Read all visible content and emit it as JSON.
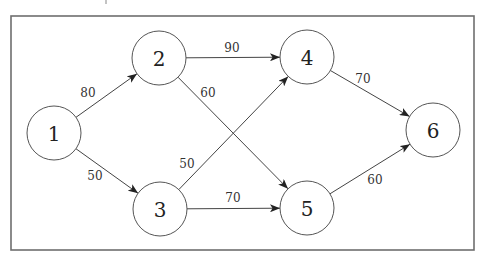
{
  "diagram": {
    "type": "directed-weighted-graph",
    "frame": {
      "x1": 11,
      "y1": 16,
      "x2": 474,
      "y2": 250
    },
    "node_radius": 27,
    "nodes": [
      {
        "id": "1",
        "label": "1",
        "x": 54,
        "y": 133
      },
      {
        "id": "2",
        "label": "2",
        "x": 159,
        "y": 58
      },
      {
        "id": "3",
        "label": "3",
        "x": 160,
        "y": 209
      },
      {
        "id": "4",
        "label": "4",
        "x": 307,
        "y": 57
      },
      {
        "id": "5",
        "label": "5",
        "x": 307,
        "y": 208
      },
      {
        "id": "6",
        "label": "6",
        "x": 433,
        "y": 130
      }
    ],
    "edges": [
      {
        "from": "1",
        "to": "2",
        "weight": "80",
        "label_x": 88,
        "label_y": 93
      },
      {
        "from": "1",
        "to": "3",
        "weight": "50",
        "label_x": 95,
        "label_y": 176
      },
      {
        "from": "2",
        "to": "4",
        "weight": "90",
        "label_x": 232,
        "label_y": 48
      },
      {
        "from": "2",
        "to": "5",
        "weight": "60",
        "label_x": 208,
        "label_y": 93
      },
      {
        "from": "3",
        "to": "4",
        "weight": "50",
        "label_x": 187,
        "label_y": 164
      },
      {
        "from": "3",
        "to": "5",
        "weight": "70",
        "label_x": 233,
        "label_y": 198
      },
      {
        "from": "4",
        "to": "6",
        "weight": "70",
        "label_x": 363,
        "label_y": 79
      },
      {
        "from": "5",
        "to": "6",
        "weight": "60",
        "label_x": 375,
        "label_y": 180
      }
    ]
  }
}
